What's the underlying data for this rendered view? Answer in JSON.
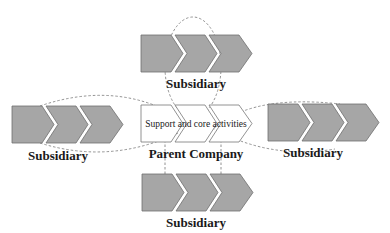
{
  "diagram": {
    "colors": {
      "chevron_fill": "#a6a6a6",
      "chevron_stroke": "#6e6e6e",
      "parent_fill": "#ffffff",
      "parent_stroke": "#777777",
      "dashed": "#777777",
      "text": "#1a1a1a"
    },
    "parent": {
      "activities_label": "Support and core activities",
      "name_label": "Parent Company"
    },
    "subsidiaries": [
      {
        "position": "top",
        "label": "Subsidiary"
      },
      {
        "position": "left",
        "label": "Subsidiary"
      },
      {
        "position": "right",
        "label": "Subsidiary"
      },
      {
        "position": "bottom",
        "label": "Subsidiary"
      }
    ]
  }
}
